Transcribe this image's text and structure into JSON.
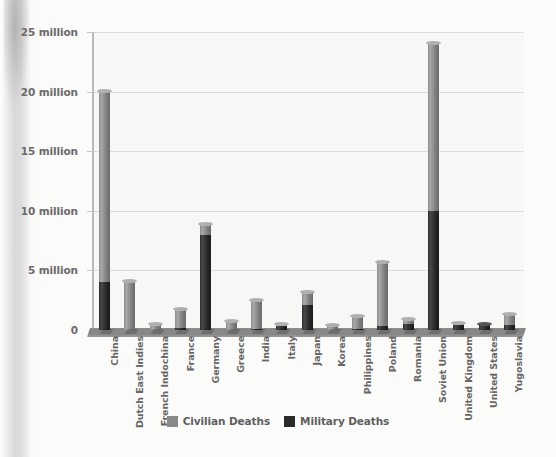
{
  "chart_data": {
    "type": "bar",
    "subtype": "stacked",
    "title": "",
    "xlabel": "",
    "ylabel": "",
    "ylim": [
      0,
      25000000
    ],
    "grid": true,
    "legend_position": "bottom",
    "y_ticks": [
      {
        "value": 0,
        "label": "0"
      },
      {
        "value": 5000000,
        "label": "5 million"
      },
      {
        "value": 10000000,
        "label": "10 million"
      },
      {
        "value": 15000000,
        "label": "15 million"
      },
      {
        "value": 20000000,
        "label": "20 million"
      },
      {
        "value": 25000000,
        "label": "25 million"
      }
    ],
    "categories": [
      "China",
      "Dutch East Indies",
      "French Indochina",
      "France",
      "Germany",
      "Greece",
      "India",
      "Italy",
      "Japan",
      "Korea",
      "Philippines",
      "Poland",
      "Romania",
      "Soviet Union",
      "United Kingdom",
      "United States",
      "Yugoslavia"
    ],
    "series": [
      {
        "name": "Military Deaths",
        "color": "#2b2b2b",
        "values": [
          4000000,
          0,
          0,
          200000,
          8000000,
          0,
          100000,
          300000,
          2100000,
          0,
          100000,
          300000,
          500000,
          10000000,
          400000,
          420000,
          450000
        ]
      },
      {
        "name": "Civilian Deaths",
        "color": "#8a8a8a",
        "values": [
          16000000,
          4000000,
          400000,
          1500000,
          800000,
          700000,
          2300000,
          150000,
          1000000,
          300000,
          1000000,
          5300000,
          350000,
          14000000,
          70000,
          20000,
          800000
        ]
      }
    ],
    "totals": [
      20000000,
      4000000,
      400000,
      1700000,
      8800000,
      700000,
      2400000,
      450000,
      3100000,
      300000,
      1100000,
      5600000,
      850000,
      24000000,
      470000,
      440000,
      1250000
    ]
  },
  "legend": {
    "items": [
      {
        "label": "Civilian Deaths",
        "color": "#8a8a8a"
      },
      {
        "label": "Military Deaths",
        "color": "#2b2b2b"
      }
    ]
  }
}
